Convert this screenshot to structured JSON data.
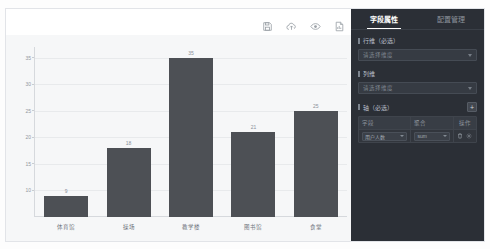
{
  "chart_data": {
    "type": "bar",
    "title": "",
    "xlabel": "",
    "ylabel": "",
    "categories": [
      "体育馆",
      "操场",
      "教学楼",
      "图书馆",
      "食堂"
    ],
    "values": [
      9,
      18,
      35,
      21,
      25
    ],
    "series": [
      {
        "name": "数量",
        "values": [
          9,
          18,
          35,
          21,
          25
        ]
      }
    ],
    "ylim": [
      5,
      37
    ],
    "yticks": [
      35,
      30,
      25,
      20,
      15,
      10
    ],
    "grid": true,
    "legend": "none",
    "bar_color": "#4d5055",
    "plot_background": "#f6f7f8",
    "data_labels": [
      "9",
      "18",
      "35",
      "21",
      "25"
    ]
  },
  "toolbar": {
    "icons": [
      {
        "name": "save-icon",
        "title": "保存"
      },
      {
        "name": "cloud-upload-icon",
        "title": "发布"
      },
      {
        "name": "eye-preview-icon",
        "title": "预览"
      },
      {
        "name": "export-report-icon",
        "title": "导出"
      }
    ]
  },
  "config": {
    "tabs": [
      {
        "label": "字段属性",
        "active": true
      },
      {
        "label": "配置管理",
        "active": false
      }
    ],
    "row_dimension": {
      "label": "行维（必选）",
      "placeholder": "请选择维度",
      "value": "请选择维度"
    },
    "col_dimension": {
      "label": "列维",
      "placeholder": "请选择维度",
      "value": "请选择维度"
    },
    "axis": {
      "label": "轴（必选）",
      "add_label": "+",
      "columns": [
        "字段",
        "聚合",
        "操作"
      ],
      "rows": [
        {
          "field": "用户人数",
          "aggregate": "sum",
          "actions": [
            "delete-icon",
            "settings-icon"
          ]
        }
      ]
    }
  }
}
